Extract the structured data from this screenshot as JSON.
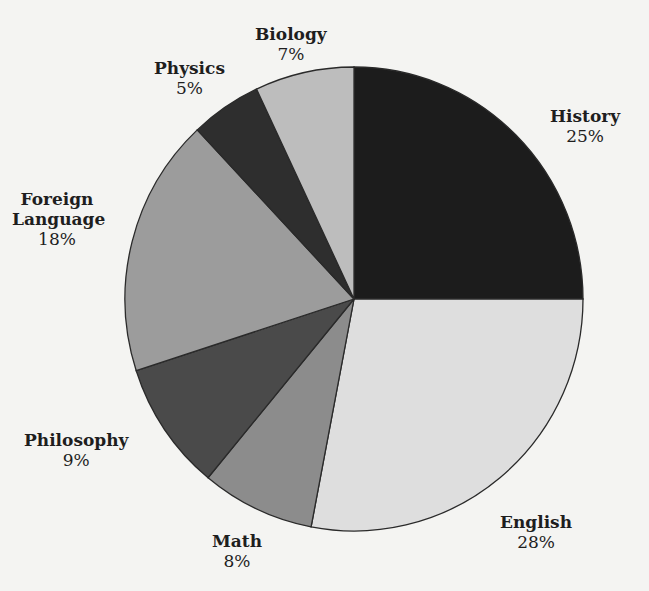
{
  "chart_data": {
    "type": "pie",
    "title": "",
    "start_angle": "12 o'clock, clockwise",
    "categories": [
      "History",
      "English",
      "Math",
      "Philosophy",
      "Foreign Language",
      "Physics",
      "Biology"
    ],
    "values": [
      25,
      28,
      8,
      9,
      18,
      5,
      7
    ],
    "unit": "%",
    "colors": [
      "#1c1c1c",
      "#dedede",
      "#8c8c8c",
      "#4a4a4a",
      "#9c9c9c",
      "#2e2e2e",
      "#bdbdbd"
    ],
    "labels": [
      {
        "name": "History",
        "pct": "25%"
      },
      {
        "name": "English",
        "pct": "28%"
      },
      {
        "name": "Math",
        "pct": "8%"
      },
      {
        "name": "Philosophy",
        "pct": "9%"
      },
      {
        "name": "Foreign Language",
        "pct": "18%"
      },
      {
        "name": "Physics",
        "pct": "5%"
      },
      {
        "name": "Biology",
        "pct": "7%"
      }
    ]
  }
}
